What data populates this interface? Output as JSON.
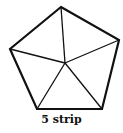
{
  "diagram": {
    "caption": "5 strip",
    "shape": "pentagon",
    "stroke_color": "#111111",
    "vertices": [
      [
        61,
        7
      ],
      [
        119,
        40
      ],
      [
        102,
        109
      ],
      [
        37,
        109
      ],
      [
        10,
        49
      ]
    ],
    "center": [
      65,
      63
    ]
  }
}
